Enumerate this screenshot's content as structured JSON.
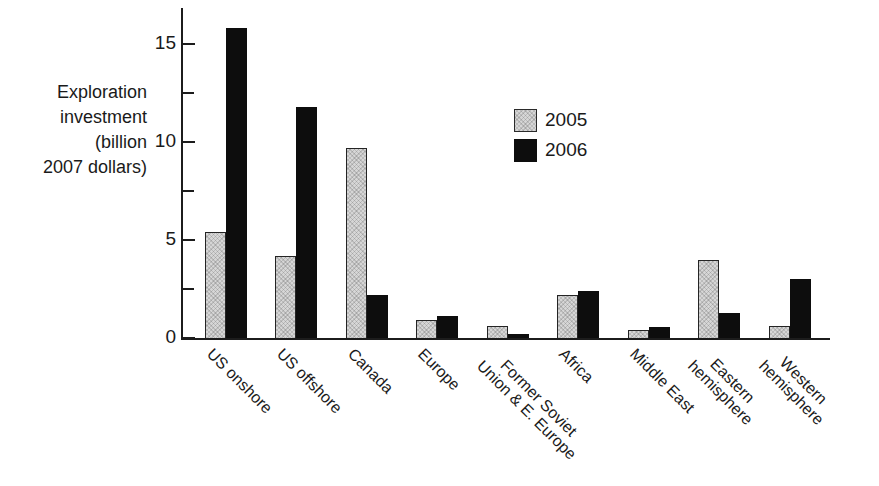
{
  "figure": {
    "background": "#ffffff",
    "text_color": "#1a1a1a"
  },
  "chart_data": {
    "type": "bar",
    "title": "",
    "ylabel": "Exploration investment (billion 2007 dollars)",
    "ylabel_display": "Exploration\ninvestment\n(billion\n2007 dollars)",
    "xlabel": "",
    "categories": [
      "US onshore",
      "US offshore",
      "Canada",
      "Europe",
      "Former Soviet Union & E. Europe",
      "Africa",
      "Middle East",
      "Eastern hemisphere",
      "Western hemisphere"
    ],
    "category_display": [
      "US onshore",
      "US offshore",
      "Canada",
      "Europe",
      "Former Soviet\nUnion & E. Europe",
      "Africa",
      "Middle East",
      "Eastern\nhemisphere",
      "Western\nhemisphere"
    ],
    "series": [
      {
        "name": "2005",
        "color": "#d6d6d6",
        "values": [
          5.4,
          4.2,
          9.7,
          0.9,
          0.6,
          2.2,
          0.4,
          4.0,
          0.6
        ]
      },
      {
        "name": "2006",
        "color": "#0d0d0d",
        "values": [
          15.8,
          11.8,
          2.2,
          1.1,
          0.2,
          2.4,
          0.55,
          1.3,
          3.0
        ]
      }
    ],
    "ylim": [
      0,
      16.8
    ],
    "yticks": [
      0,
      5,
      10,
      15
    ],
    "yticks_minor": [
      2.5,
      7.5,
      12.5
    ],
    "grid": false,
    "legend_position": "upper center-right inside"
  }
}
